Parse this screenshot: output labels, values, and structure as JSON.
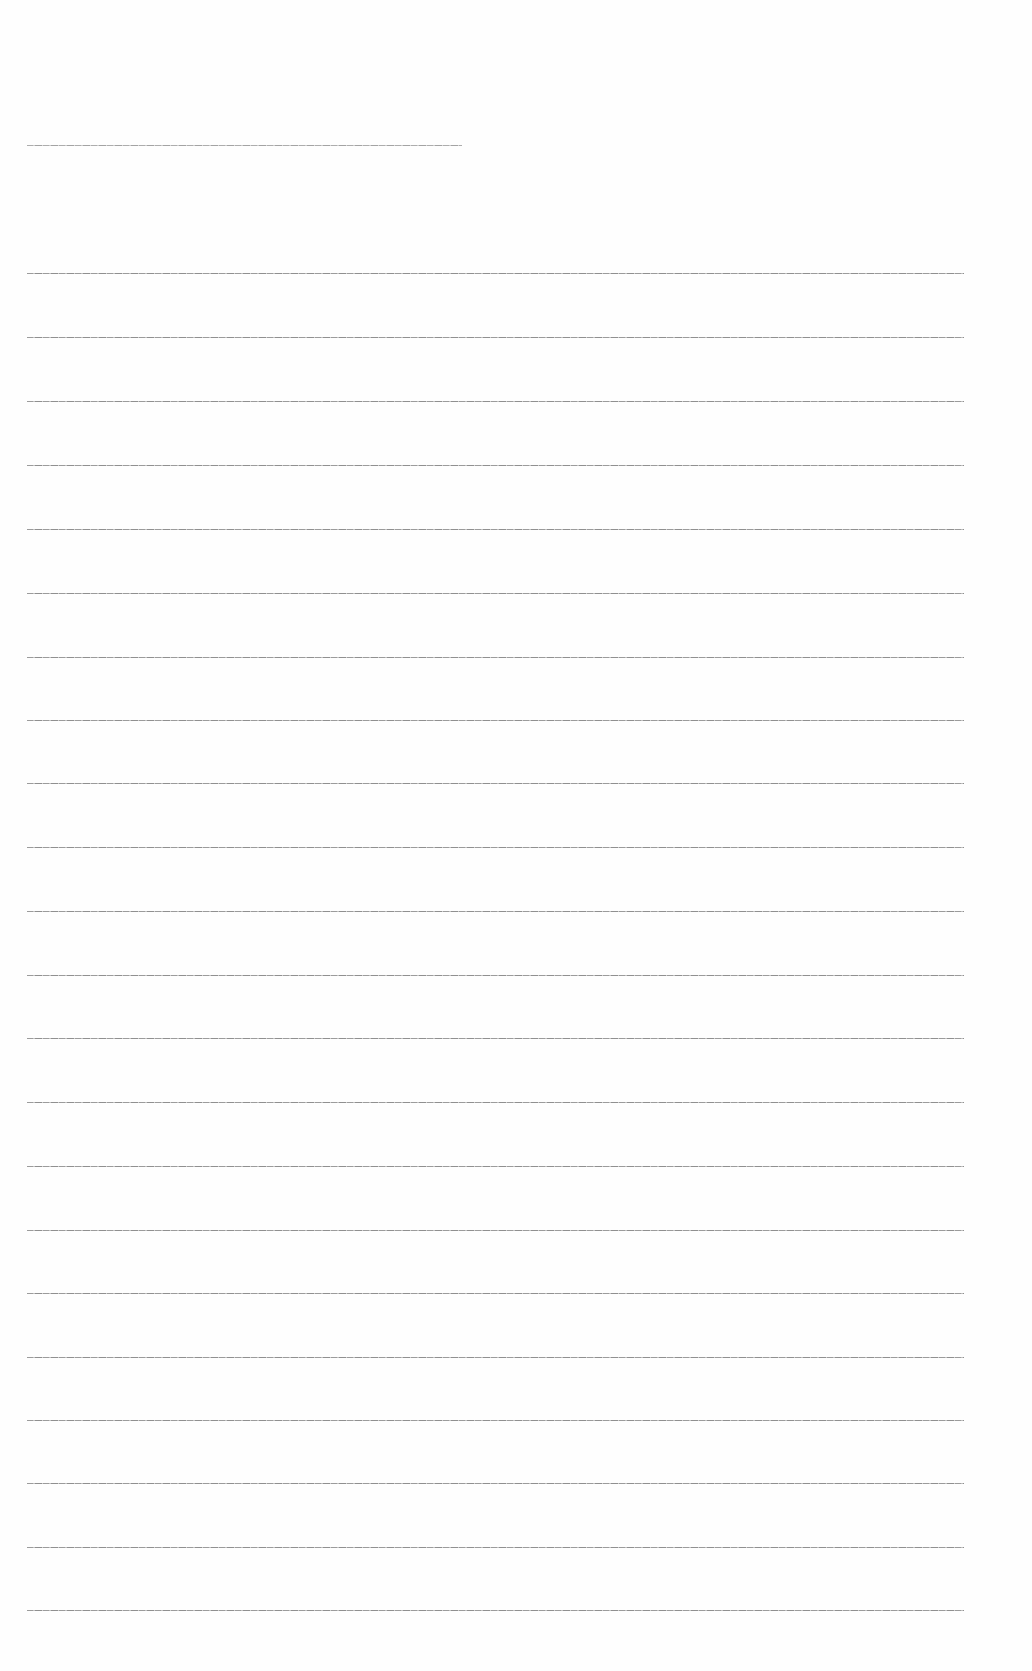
{
  "page": {
    "type": "blank ruled sheet",
    "background": "#fefefe",
    "rule_color": "#8a8a8a",
    "header_rule": {
      "x1": 27,
      "x2": 462,
      "y": 145
    },
    "rules": {
      "x1": 27,
      "x2": 964,
      "y_positions": [
        273,
        337,
        401,
        465,
        529,
        593,
        657,
        720,
        783,
        847,
        911,
        975,
        1038,
        1102,
        1166,
        1230,
        1293,
        1357,
        1420,
        1483,
        1547,
        1610
      ]
    }
  }
}
